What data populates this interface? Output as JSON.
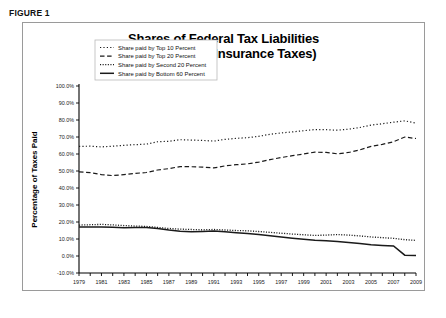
{
  "figure": {
    "label": "FIGURE 1"
  },
  "chart_data": {
    "type": "line",
    "title": "Shares of Federal Tax Liabilities",
    "subtitle": "(Net of Social Insurance Taxes)",
    "xlabel": "Year",
    "ylabel": "Percentage of Taxes Paid",
    "grid": false,
    "legend_position": "top-left",
    "xlim": [
      1979,
      2009
    ],
    "ylim": [
      -10,
      100
    ],
    "ytick_values": [
      100,
      90,
      80,
      70,
      60,
      50,
      40,
      30,
      20,
      10,
      0,
      -10
    ],
    "ytick_labels": [
      "100.0%",
      "90.0%",
      "80.0%",
      "70.0%",
      "60.0%",
      "50.0%",
      "40.0%",
      "30.0%",
      "20.0%",
      "10.0%",
      "0.0%",
      "-10.0%"
    ],
    "xtick_values": [
      1979,
      1981,
      1983,
      1985,
      1987,
      1989,
      1991,
      1993,
      1995,
      1997,
      1999,
      2001,
      2003,
      2005,
      2007,
      2009
    ],
    "xtick_labels": [
      "1979",
      "1981",
      "1983",
      "1985",
      "1987",
      "1989",
      "1991",
      "1993",
      "1995",
      "1997",
      "1999",
      "2001",
      "2003",
      "2005",
      "2007",
      "2009"
    ],
    "x": [
      1979,
      1980,
      1981,
      1982,
      1983,
      1984,
      1985,
      1986,
      1987,
      1988,
      1989,
      1990,
      1991,
      1992,
      1993,
      1994,
      1995,
      1996,
      1997,
      1998,
      1999,
      2000,
      2001,
      2002,
      2003,
      2004,
      2005,
      2006,
      2007,
      2008,
      2009
    ],
    "series": [
      {
        "name": "Share paid by Top 10 Percent",
        "style": "dotted-sparse",
        "values": [
          64.5,
          64.6,
          64.2,
          64.6,
          65.1,
          65.5,
          65.8,
          67.2,
          67.5,
          68.4,
          68.2,
          68.0,
          67.6,
          68.6,
          69.2,
          69.6,
          70.4,
          71.6,
          72.4,
          73.0,
          73.7,
          74.4,
          74.3,
          74.0,
          74.6,
          75.6,
          77.0,
          77.8,
          78.7,
          79.5,
          78.2
        ]
      },
      {
        "name": "Share paid by Top 20 Percent",
        "style": "dashed",
        "values": [
          49.5,
          49.0,
          47.9,
          47.3,
          47.9,
          48.6,
          49.1,
          50.6,
          51.4,
          52.6,
          52.5,
          52.3,
          51.8,
          53.0,
          53.7,
          54.2,
          55.2,
          56.7,
          57.9,
          59.0,
          60.0,
          61.1,
          60.9,
          60.1,
          60.9,
          62.4,
          64.5,
          65.7,
          67.2,
          70.0,
          69.1
        ]
      },
      {
        "name": "Share paid by Second 20 Percent",
        "style": "dotted-fine",
        "values": [
          18.2,
          18.4,
          18.6,
          18.3,
          17.9,
          17.6,
          17.4,
          16.8,
          16.2,
          15.8,
          15.6,
          15.4,
          15.6,
          15.3,
          15.0,
          14.8,
          14.4,
          13.9,
          13.4,
          12.9,
          12.5,
          12.1,
          12.3,
          12.6,
          12.3,
          11.8,
          11.2,
          10.8,
          10.4,
          9.6,
          9.2
        ]
      },
      {
        "name": "Share paid by Bottom 60 Percent",
        "style": "solid",
        "values": [
          17.0,
          17.0,
          17.1,
          16.9,
          16.6,
          16.7,
          16.8,
          16.2,
          15.3,
          14.6,
          14.2,
          14.4,
          14.7,
          14.2,
          13.7,
          13.2,
          12.6,
          11.9,
          11.2,
          10.5,
          9.8,
          9.2,
          8.9,
          8.5,
          7.9,
          7.3,
          6.6,
          6.2,
          5.9,
          0.5,
          0.3
        ]
      }
    ]
  }
}
